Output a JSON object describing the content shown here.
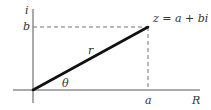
{
  "diagram": {
    "axes": {
      "vertical_label": "i",
      "horizontal_label": "R"
    },
    "point": {
      "label": "z = a + bi",
      "x_label": "a",
      "y_label": "b"
    },
    "vector": {
      "magnitude_label": "r",
      "angle_label": "θ"
    },
    "colors": {
      "axis": "#555555",
      "vector": "#111111",
      "dashed": "#777777",
      "text": "#333333"
    }
  }
}
